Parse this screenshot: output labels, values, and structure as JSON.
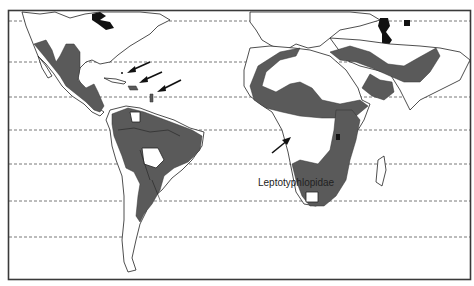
{
  "map": {
    "title": "Leptotyphlopidae",
    "type": "distribution-map",
    "projection": "world, Americas-Africa-Asia region",
    "range_color": "#5a5a5a",
    "regions_shaded": [
      "Southwestern United States and Mexico",
      "Central America",
      "Caribbean islands (Bahamas, Hispaniola, Lesser Antilles)",
      "South America (northern and central)",
      "North Africa and Sahel belt",
      "Arabian Peninsula to Pakistan",
      "East Africa",
      "Southern Africa"
    ],
    "arrows": [
      {
        "points_to": "Bahamas"
      },
      {
        "points_to": "Hispaniola"
      },
      {
        "points_to": "Lesser Antilles"
      },
      {
        "points_to": "West Central Africa coast"
      }
    ],
    "latitude_lines": 7
  }
}
